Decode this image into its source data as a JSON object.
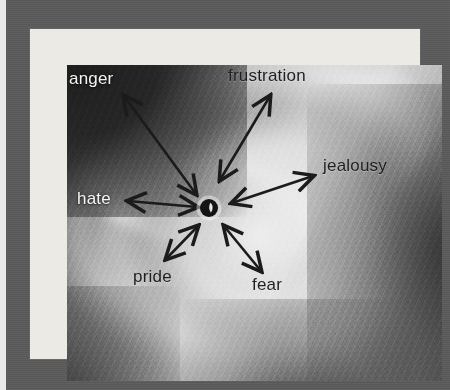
{
  "figure": {
    "type": "radial-concept-diagram",
    "center_node": {
      "name": "storm-eye",
      "label": "",
      "cx": 209,
      "cy": 208,
      "r": 9
    },
    "colors": {
      "mat_gray": "#5a5a5a",
      "frame_white": "#eceae4",
      "arrow_black": "#1b1b1b",
      "light_label": "#f4f4f2",
      "dark_label": "#1f1f1f",
      "outer_strip": "#e9e9e7"
    },
    "labels": [
      {
        "id": "anger",
        "text": "anger",
        "tone": "light",
        "x": 69,
        "y": 70,
        "size": 17
      },
      {
        "id": "frustration",
        "text": "frustration",
        "tone": "dark",
        "x": 228,
        "y": 67,
        "size": 17
      },
      {
        "id": "jealousy",
        "text": "jealousy",
        "tone": "dark",
        "x": 323,
        "y": 157,
        "size": 17
      },
      {
        "id": "hate",
        "text": "hate",
        "tone": "light",
        "x": 77,
        "y": 190,
        "size": 17
      },
      {
        "id": "pride",
        "text": "pride",
        "tone": "dark",
        "x": 133,
        "y": 268,
        "size": 17
      },
      {
        "id": "fear",
        "text": "fear",
        "tone": "dark",
        "x": 252,
        "y": 276,
        "size": 17
      }
    ],
    "arrows": [
      {
        "id": "arrow-anger",
        "label": "anger",
        "x1": 124,
        "y1": 96,
        "x2": 196,
        "y2": 194,
        "double": true
      },
      {
        "id": "arrow-frustration",
        "label": "frustration",
        "x1": 270,
        "y1": 96,
        "x2": 220,
        "y2": 180,
        "double": true
      },
      {
        "id": "arrow-jealousy",
        "label": "jealousy",
        "x1": 313,
        "y1": 176,
        "x2": 232,
        "y2": 203,
        "double": true
      },
      {
        "id": "arrow-hate",
        "label": "hate",
        "x1": 128,
        "y1": 201,
        "x2": 197,
        "y2": 207,
        "double": true
      },
      {
        "id": "arrow-pride",
        "label": "pride",
        "x1": 166,
        "y1": 259,
        "x2": 198,
        "y2": 226,
        "double": true
      },
      {
        "id": "arrow-fear",
        "label": "fear",
        "x1": 261,
        "y1": 271,
        "x2": 224,
        "y2": 226,
        "double": true
      }
    ]
  }
}
